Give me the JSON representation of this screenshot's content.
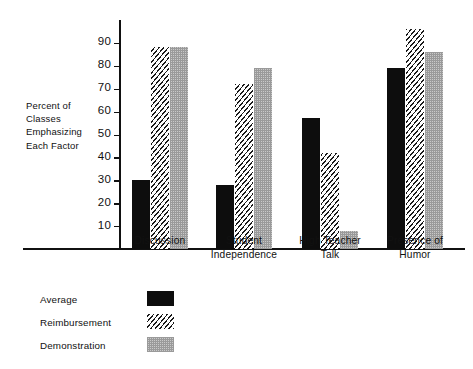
{
  "chart_data": {
    "type": "bar",
    "title": "",
    "subtitle": "",
    "xlabel": "",
    "ylabel": "Percent of Classes Emphasizing Each Factor",
    "ylabel_lines": [
      "Percent of",
      "Classes",
      "Emphasizing",
      "Each Factor"
    ],
    "categories": [
      "Discussion",
      "Student Independence",
      "High Teacher Talk",
      "Presence of Humor"
    ],
    "category_label_lines": [
      [
        "Discussion"
      ],
      [
        "Student",
        "Independence"
      ],
      [
        "High Teacher",
        "Talk"
      ],
      [
        "Presence of",
        "Humor"
      ]
    ],
    "series": [
      {
        "name": "Average",
        "pattern": "solid-black",
        "values": [
          30,
          28,
          57,
          79
        ]
      },
      {
        "name": "Reimbursement",
        "pattern": "diagonal-hatch",
        "values": [
          88,
          72,
          42,
          96
        ]
      },
      {
        "name": "Demonstration",
        "pattern": "gray-stipple",
        "values": [
          88,
          79,
          8,
          86
        ]
      }
    ],
    "ylim": [
      0,
      100
    ],
    "yticks": [
      10,
      20,
      30,
      40,
      50,
      60,
      70,
      80,
      90
    ],
    "ytick_labels": [
      "10",
      "20",
      "30",
      "40",
      "50",
      "60",
      "70",
      "80",
      "90"
    ],
    "grid": false,
    "legend_position": "below-left",
    "colors": {
      "average": "#0d0d0d",
      "reimbursement": "#1a1a1a",
      "demonstration": "#9a9a9a",
      "axis": "#111111",
      "background": "#ffffff"
    }
  },
  "legend": {
    "items": [
      {
        "label": "Average",
        "swatch": "solid-black-swatch"
      },
      {
        "label": "Reimbursement",
        "swatch": "diagonal-hatch-swatch"
      },
      {
        "label": "Demonstration",
        "swatch": "gray-stipple-swatch"
      }
    ]
  }
}
